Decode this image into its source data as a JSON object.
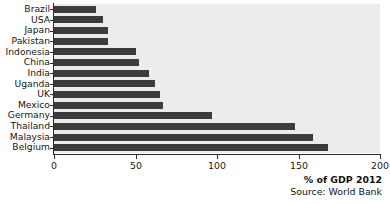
{
  "chart_data": {
    "type": "bar",
    "orientation": "horizontal",
    "title": "",
    "subtitle": "",
    "xlabel": "% of GDP 2012",
    "ylabel": "",
    "source": "Source: World Bank",
    "xlim": [
      0,
      200
    ],
    "xticks": [
      0,
      50,
      100,
      150,
      200
    ],
    "xtick_labels": [
      "0",
      "50",
      "100",
      "150",
      "200"
    ],
    "grid": false,
    "legend": null,
    "bar_color": "#3c3c3c",
    "plot_background": "#ececec",
    "page_background": "#ffffff",
    "categories": [
      "Brazil",
      "USA",
      "Japan",
      "Pakistan",
      "Indonesia",
      "China",
      "India",
      "Uganda",
      "UK",
      "Mexico",
      "Germany",
      "Thailand",
      "Malaysia",
      "Belgium"
    ],
    "values": [
      26,
      30,
      33,
      33,
      50,
      52,
      58,
      62,
      65,
      67,
      97,
      148,
      159,
      168
    ]
  }
}
